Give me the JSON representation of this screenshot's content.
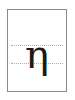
{
  "card": {
    "glyph": "η",
    "glyph_name": "greek-small-letter-eta",
    "guides": [
      "x-height",
      "baseline"
    ],
    "colors": {
      "border": "#8a8a8a",
      "guide": "#b0b0b0",
      "glyph": "#1a1a1a"
    }
  }
}
